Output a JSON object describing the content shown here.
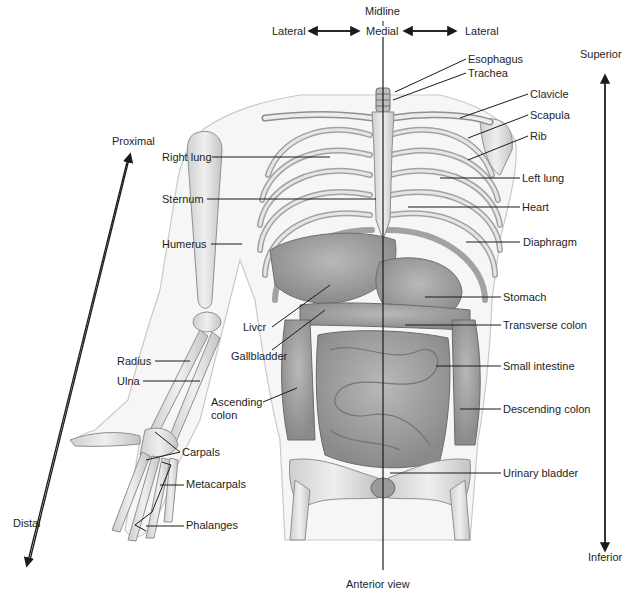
{
  "title": "Anterior view",
  "orientation": {
    "midline": "Midline",
    "medial": "Medial",
    "lateral_left": "Lateral",
    "lateral_right": "Lateral",
    "superior": "Superior",
    "inferior": "Inferior",
    "proximal": "Proximal",
    "distal": "Distal"
  },
  "labels_left": [
    {
      "text": "Right lung",
      "x": 162,
      "y": 151
    },
    {
      "text": "Sternum",
      "x": 162,
      "y": 193
    },
    {
      "text": "Humerus",
      "x": 162,
      "y": 238
    },
    {
      "text": "Livcr",
      "x": 243,
      "y": 321
    },
    {
      "text": "Gallbladder",
      "x": 231,
      "y": 350
    },
    {
      "text": "Radius",
      "x": 117,
      "y": 355
    },
    {
      "text": "Ulna",
      "x": 117,
      "y": 375
    },
    {
      "text": "Ascending colon",
      "x": 211,
      "y": 396
    },
    {
      "text": "Carpals",
      "x": 182,
      "y": 446
    },
    {
      "text": "Metacarpals",
      "x": 186,
      "y": 478
    },
    {
      "text": "Phalanges",
      "x": 186,
      "y": 519
    }
  ],
  "labels_right": [
    {
      "text": "Esophagus",
      "x": 468,
      "y": 53
    },
    {
      "text": "Trachea",
      "x": 468,
      "y": 67
    },
    {
      "text": "Clavicle",
      "x": 530,
      "y": 88
    },
    {
      "text": "Scapula",
      "x": 530,
      "y": 109
    },
    {
      "text": "Rib",
      "x": 530,
      "y": 130
    },
    {
      "text": "Left lung",
      "x": 522,
      "y": 172
    },
    {
      "text": "Heart",
      "x": 522,
      "y": 201
    },
    {
      "text": "Diaphragm",
      "x": 523,
      "y": 236
    },
    {
      "text": "Stomach",
      "x": 503,
      "y": 291
    },
    {
      "text": "Transverse colon",
      "x": 503,
      "y": 319
    },
    {
      "text": "Small intestine",
      "x": 503,
      "y": 360
    },
    {
      "text": "Descending colon",
      "x": 503,
      "y": 403
    },
    {
      "text": "Urinary bladder",
      "x": 503,
      "y": 467
    }
  ],
  "colors": {
    "skin_outline": "#c9c9c9",
    "bone": "#e3e3e3",
    "bone_stroke": "#8f8f8f",
    "organ": "#a8a8a8",
    "organ_dark": "#7d7d7d",
    "line": "#1a1a1a"
  }
}
